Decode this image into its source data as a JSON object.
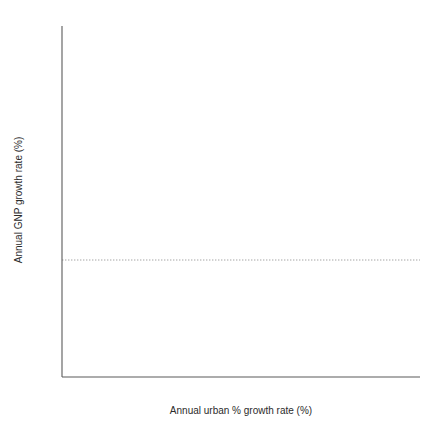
{
  "chart_data": {
    "type": "scatter",
    "title": "",
    "xlabel": "Annual urban % growth rate (%)",
    "ylabel": "Annual GNP growth rate (%)",
    "xlim": [
      0,
      11.2
    ],
    "ylim": [
      -5,
      10
    ],
    "x_ticks": [
      0,
      2,
      4,
      6,
      8,
      10
    ],
    "x_tick_labels": [
      "0",
      "2",
      "4",
      "6",
      "8",
      "10"
    ],
    "x_minor_step": 1,
    "y_ticks": [
      -5,
      0,
      5,
      10
    ],
    "y_tick_labels": [
      "-5",
      "0",
      "5",
      "10"
    ],
    "y_minor_step": 1,
    "grid": false,
    "legend": null,
    "annotations": [
      {
        "kind": "reference-line",
        "axis": "y",
        "value": 0,
        "style": "dotted",
        "color": "#9a9a9a"
      }
    ],
    "marker": {
      "shape": "circle",
      "color": "#000000",
      "size": 3.0
    },
    "points": [
      [
        0.2,
        2.1
      ],
      [
        0.25,
        2.05
      ],
      [
        0.28,
        1.95
      ],
      [
        0.32,
        1.85
      ],
      [
        0.35,
        2.0
      ],
      [
        0.4,
        2.1
      ],
      [
        0.45,
        2.15
      ],
      [
        0.5,
        2.15
      ],
      [
        0.3,
        1.5
      ],
      [
        0.34,
        1.25
      ],
      [
        0.45,
        1.45
      ],
      [
        0.48,
        1.2
      ],
      [
        0.6,
        5.55
      ],
      [
        0.62,
        3.55
      ],
      [
        0.63,
        3.35
      ],
      [
        0.7,
        2.6
      ],
      [
        0.72,
        1.5
      ],
      [
        0.75,
        -0.6
      ],
      [
        0.62,
        -2.25
      ],
      [
        0.82,
        -2.5
      ],
      [
        1.0,
        6.15
      ],
      [
        1.02,
        -0.1
      ],
      [
        1.05,
        0.35
      ],
      [
        1.08,
        0.65
      ],
      [
        1.1,
        1.5
      ],
      [
        1.15,
        -1.05
      ],
      [
        1.25,
        5.45
      ],
      [
        1.2,
        3.35
      ],
      [
        1.22,
        1.55
      ],
      [
        1.26,
        1.45
      ],
      [
        1.28,
        1.15
      ],
      [
        1.32,
        0.25
      ],
      [
        1.35,
        2.55
      ],
      [
        1.45,
        1.05
      ],
      [
        1.78,
        -1.6
      ],
      [
        1.8,
        -2.85
      ],
      [
        1.82,
        -3.55
      ],
      [
        1.85,
        -4.3
      ],
      [
        1.88,
        -0.5
      ],
      [
        1.9,
        3.55
      ],
      [
        1.92,
        2.25
      ],
      [
        1.95,
        0.05
      ],
      [
        2.05,
        0.1
      ],
      [
        2.15,
        2.5
      ],
      [
        2.2,
        -2.9
      ],
      [
        2.3,
        -3.4
      ],
      [
        2.32,
        -3.15
      ],
      [
        2.4,
        -4.35
      ],
      [
        2.42,
        1.9
      ],
      [
        2.45,
        -2.0
      ],
      [
        2.48,
        -0.25
      ],
      [
        2.55,
        -0.3
      ],
      [
        2.58,
        -0.8
      ],
      [
        2.62,
        0.35
      ],
      [
        2.75,
        6.5
      ],
      [
        2.85,
        -2.75
      ],
      [
        3.0,
        1.25
      ],
      [
        3.1,
        1.6
      ],
      [
        3.15,
        -1.75
      ],
      [
        3.2,
        2.85
      ],
      [
        3.3,
        2.95
      ],
      [
        3.32,
        1.2
      ],
      [
        3.4,
        -0.65
      ],
      [
        3.45,
        -1.35
      ],
      [
        3.55,
        8.1
      ],
      [
        3.58,
        1.05
      ],
      [
        3.62,
        0.55
      ],
      [
        3.68,
        0.2
      ],
      [
        3.7,
        0.05
      ],
      [
        3.72,
        0.0
      ],
      [
        3.75,
        2.55
      ],
      [
        3.82,
        -1.65
      ],
      [
        3.85,
        -3.1
      ],
      [
        3.9,
        0.7
      ],
      [
        3.95,
        -0.05
      ],
      [
        4.05,
        0.0
      ],
      [
        4.1,
        -0.85
      ],
      [
        4.2,
        3.45
      ],
      [
        4.22,
        2.95
      ],
      [
        4.25,
        0.05
      ],
      [
        4.3,
        8.1
      ],
      [
        4.4,
        -0.55
      ],
      [
        4.5,
        -0.45
      ],
      [
        4.55,
        -0.9
      ],
      [
        4.6,
        -0.7
      ],
      [
        4.65,
        -0.75
      ],
      [
        4.7,
        -1.3
      ],
      [
        4.75,
        4.05
      ],
      [
        4.95,
        -1.7
      ],
      [
        5.05,
        -2.2
      ],
      [
        5.15,
        -4.2
      ],
      [
        5.2,
        -4.75
      ],
      [
        5.3,
        2.15
      ],
      [
        5.32,
        2.35
      ],
      [
        5.35,
        -0.3
      ],
      [
        5.4,
        -0.35
      ],
      [
        5.45,
        -2.25
      ],
      [
        5.48,
        -1.15
      ],
      [
        5.55,
        -0.35
      ],
      [
        5.6,
        -3.55
      ],
      [
        5.65,
        -4.45
      ],
      [
        5.95,
        -0.3
      ],
      [
        6.0,
        -2.65
      ],
      [
        6.05,
        0.75
      ],
      [
        6.5,
        0.0
      ],
      [
        6.6,
        1.0
      ],
      [
        6.62,
        -0.65
      ],
      [
        6.7,
        -1.4
      ],
      [
        6.8,
        0.25
      ],
      [
        6.9,
        -0.85
      ],
      [
        7.65,
        6.2
      ],
      [
        7.7,
        1.95
      ],
      [
        8.35,
        3.35
      ],
      [
        8.4,
        -1.65
      ],
      [
        10.45,
        0.75
      ]
    ]
  },
  "figure": {
    "background": "#ffffff",
    "axis_color": "#5a5a5a",
    "marker_color": "#000000",
    "zero_line_color": "#9a9a9a"
  }
}
